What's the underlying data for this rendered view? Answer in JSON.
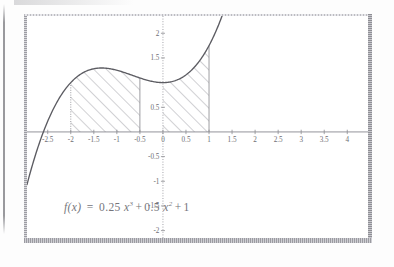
{
  "figure": {
    "caption_formula": "f(x) = 0.25 x^3 + 0.5 x^2 + 1",
    "formula_parts": {
      "fx": "f(x)",
      "equals": "=",
      "coef_cubic": "0.25",
      "var_cubic": "x",
      "exp_cubic": "3",
      "plus1": "+",
      "coef_quad": "0.5",
      "var_quad": "x",
      "exp_quad": "2",
      "plus2": "+",
      "constant": "1"
    }
  },
  "axes": {
    "x_tick_labels": [
      "-2.5",
      "-2",
      "-1.5",
      "-1",
      "-0.5",
      "0",
      "0.5",
      "1",
      "1.5",
      "2",
      "2.5",
      "3",
      "3.5",
      "4"
    ],
    "x_tick_values": [
      -2.5,
      -2,
      -1.5,
      -1,
      -0.5,
      0,
      0.5,
      1,
      1.5,
      2,
      2.5,
      3,
      3.5,
      4
    ],
    "y_tick_labels": [
      "2",
      "1.5",
      "0.5",
      "-0.5",
      "-1",
      "-1.5",
      "-2"
    ],
    "y_tick_values": [
      2,
      1.5,
      0.5,
      -0.5,
      -1,
      -1.5,
      -2
    ],
    "xlim": [
      -2.95,
      4.45
    ],
    "ylim": [
      -2.15,
      2.35
    ],
    "origin_label": "0"
  },
  "chart_data": {
    "type": "line",
    "title": "",
    "subtitle": "",
    "xlabel": "",
    "ylabel": "",
    "grid": false,
    "legend": "none",
    "xlim": [
      -2.95,
      4.45
    ],
    "ylim": [
      -2.15,
      2.35
    ],
    "function_expression": "f(x) = 0.25*x^3 + 0.5*x^2 + 1",
    "coefficients": {
      "cubic": 0.25,
      "quadratic": 0.5,
      "linear": 0,
      "constant": 1
    },
    "annotations": [
      "f(x)  =  0.25 x^3 + 0.5 x^2 + 1"
    ],
    "x": [
      -2.95,
      -2.8,
      -2.6,
      -2.4,
      -2.2,
      -2.0,
      -1.8,
      -1.6,
      -1.4,
      -1.2,
      -1.0,
      -0.8,
      -0.6,
      -0.4,
      -0.2,
      0.0,
      0.2,
      0.4,
      0.6,
      0.8,
      1.0,
      1.1,
      1.2,
      1.25
    ],
    "y": [
      -1.07,
      -0.57,
      -0.01,
      0.42,
      0.76,
      1.0,
      1.16,
      1.26,
      1.3,
      1.29,
      1.25,
      1.19,
      1.13,
      1.06,
      1.02,
      1.0,
      1.02,
      1.1,
      1.23,
      1.45,
      1.75,
      1.94,
      2.15,
      2.27
    ],
    "shaded_regions": [
      {
        "name": "left-integral-region",
        "x_from": -2,
        "x_to": -0.5,
        "hatch": "diagonal-45",
        "y_from": 0
      },
      {
        "name": "right-integral-region",
        "x_from": 0,
        "x_to": 1,
        "hatch": "diagonal-45",
        "y_from": 0
      }
    ],
    "boundary_lines": [
      {
        "x": -2,
        "style": "dotted"
      },
      {
        "x": -0.5,
        "style": "solid"
      },
      {
        "x": 0,
        "style": "solid"
      },
      {
        "x": 1,
        "style": "solid"
      }
    ],
    "x_axis_intercept": -2.6
  }
}
